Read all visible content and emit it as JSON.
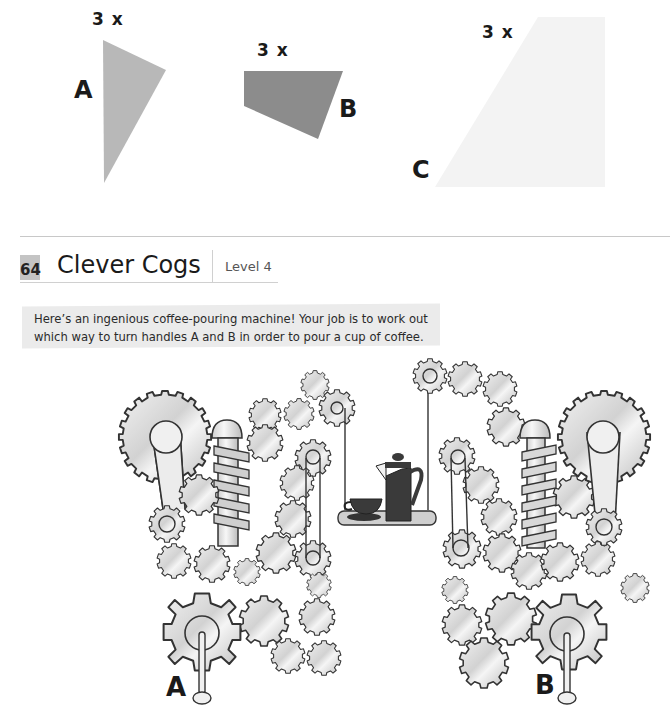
{
  "shapes": [
    {
      "id": "A",
      "multiplier": "3 x",
      "label": "A",
      "fill": "#b8b8b8"
    },
    {
      "id": "B",
      "multiplier": "3 x",
      "label": "B",
      "fill": "#8c8c8c"
    },
    {
      "id": "C",
      "multiplier": "3 x",
      "label": "C",
      "fill": "#f4f4f4"
    }
  ],
  "puzzle": {
    "number": "64",
    "title": "Clever Cogs",
    "level": "Level 4",
    "number_bg": "#c4c4c4",
    "intro": "Here’s an ingenious coffee-pouring machine! Your job is to work out which way to turn handles A and B in order to pour a cup of coffee."
  },
  "machine": {
    "handles": [
      {
        "id": "A",
        "label": "A"
      },
      {
        "id": "B",
        "label": "B"
      }
    ],
    "items": [
      "cup-and-saucer",
      "coffee-pot",
      "hanging-tray"
    ],
    "colors": {
      "gear_fill": "#e2e2e2",
      "outline": "#333333",
      "pot": "#3a3a3a",
      "tray": "#cfcfcf"
    }
  }
}
